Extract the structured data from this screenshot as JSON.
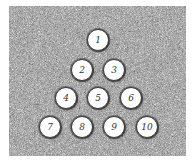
{
  "puzzle": {
    "type": "triangle-peg-layout",
    "rows": [
      [
        "1"
      ],
      [
        "2",
        "3"
      ],
      [
        "4",
        "5",
        "6"
      ],
      [
        "7",
        "8",
        "9",
        "10"
      ]
    ],
    "pegs": [
      {
        "label": "1",
        "x": 98,
        "y": 40
      },
      {
        "label": "2",
        "x": 82,
        "y": 70
      },
      {
        "label": "3",
        "x": 114,
        "y": 70
      },
      {
        "label": "4",
        "x": 66,
        "y": 98
      },
      {
        "label": "5",
        "x": 98,
        "y": 98
      },
      {
        "label": "6",
        "x": 131,
        "y": 98
      },
      {
        "label": "7",
        "x": 50,
        "y": 127
      },
      {
        "label": "8",
        "x": 82,
        "y": 127
      },
      {
        "label": "9",
        "x": 114,
        "y": 127
      },
      {
        "label": "10",
        "x": 147,
        "y": 127
      }
    ]
  },
  "colors": {
    "board": "#8a8a8a",
    "peg_fill": "#ffffff",
    "peg_outline": "#3a3a3a",
    "label": "#333333"
  }
}
